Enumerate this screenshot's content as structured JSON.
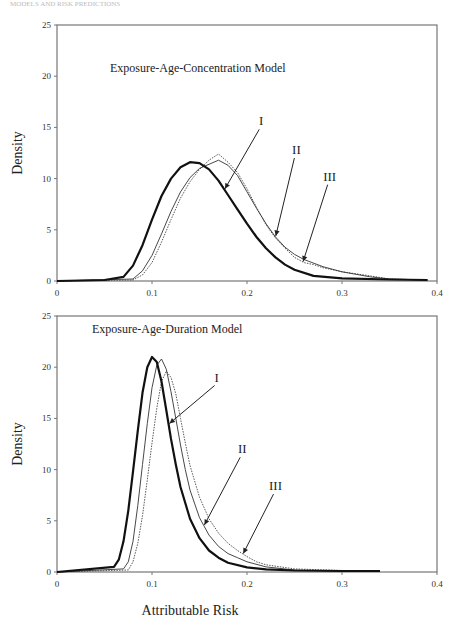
{
  "header": {
    "running_head": "MODELS AND RISK PREDICTIONS"
  },
  "chart_data": [
    {
      "type": "line",
      "title": "Exposure-Age-Concentration Model",
      "xlabel": "",
      "ylabel": "Density",
      "xlim": [
        0,
        0.4
      ],
      "ylim": [
        0,
        25
      ],
      "xticks": [
        "0",
        "0.1",
        "0.2",
        "0.3",
        "0.4"
      ],
      "yticks": [
        "0",
        "5",
        "10",
        "15",
        "20",
        "25"
      ],
      "grid": false,
      "legend": "inline arrow annotations",
      "series": [
        {
          "name": "I",
          "style": "thick solid",
          "x": [
            0,
            0.05,
            0.07,
            0.08,
            0.09,
            0.1,
            0.11,
            0.12,
            0.13,
            0.14,
            0.15,
            0.16,
            0.17,
            0.18,
            0.19,
            0.2,
            0.21,
            0.22,
            0.23,
            0.24,
            0.25,
            0.27,
            0.3,
            0.35,
            0.39
          ],
          "y": [
            0,
            0.1,
            0.4,
            1.5,
            3.5,
            6.0,
            8.3,
            10.0,
            11.1,
            11.6,
            11.5,
            10.9,
            9.8,
            8.4,
            7.0,
            5.6,
            4.3,
            3.2,
            2.3,
            1.6,
            1.1,
            0.5,
            0.25,
            0.15,
            0.1
          ]
        },
        {
          "name": "II",
          "style": "thin solid",
          "x": [
            0,
            0.08,
            0.09,
            0.1,
            0.11,
            0.12,
            0.13,
            0.14,
            0.15,
            0.16,
            0.17,
            0.18,
            0.19,
            0.2,
            0.21,
            0.22,
            0.23,
            0.24,
            0.25,
            0.26,
            0.28,
            0.3,
            0.33,
            0.35,
            0.39
          ],
          "y": [
            0,
            0.2,
            1.0,
            2.5,
            4.6,
            6.8,
            8.7,
            10.1,
            11.0,
            11.4,
            11.8,
            11.3,
            10.3,
            8.7,
            7.1,
            5.6,
            4.3,
            3.3,
            2.6,
            2.1,
            1.4,
            0.9,
            0.4,
            0.2,
            0.1
          ]
        },
        {
          "name": "III",
          "style": "dotted thin",
          "x": [
            0,
            0.08,
            0.09,
            0.1,
            0.11,
            0.12,
            0.13,
            0.14,
            0.15,
            0.16,
            0.17,
            0.18,
            0.19,
            0.2,
            0.21,
            0.22,
            0.23,
            0.24,
            0.25,
            0.26,
            0.27,
            0.28,
            0.3,
            0.33,
            0.35,
            0.39
          ],
          "y": [
            0,
            0.1,
            0.6,
            1.8,
            3.8,
            6.0,
            8.1,
            9.7,
            10.9,
            11.8,
            12.4,
            11.6,
            10.6,
            9.0,
            7.2,
            5.5,
            4.2,
            3.2,
            2.3,
            1.8,
            1.6,
            1.3,
            0.9,
            0.5,
            0.2,
            0.1
          ]
        }
      ],
      "annotations": [
        {
          "text": "I",
          "x": 0.215,
          "y": 15.2
        },
        {
          "text": "II",
          "x": 0.252,
          "y": 12.4
        },
        {
          "text": "III",
          "x": 0.287,
          "y": 9.8
        }
      ]
    },
    {
      "type": "line",
      "title": "Exposure-Age-Duration Model",
      "xlabel": "Attributable Risk",
      "ylabel": "Density",
      "xlim": [
        0,
        0.4
      ],
      "ylim": [
        0,
        25
      ],
      "xticks": [
        "0",
        "0.1",
        "0.2",
        "0.3",
        "0.4"
      ],
      "yticks": [
        "0",
        "5",
        "10",
        "15",
        "20",
        "25"
      ],
      "grid": false,
      "legend": "inline arrow annotations",
      "series": [
        {
          "name": "I",
          "style": "thick solid",
          "x": [
            0,
            0.06,
            0.065,
            0.07,
            0.075,
            0.08,
            0.085,
            0.09,
            0.095,
            0.1,
            0.105,
            0.11,
            0.115,
            0.12,
            0.125,
            0.13,
            0.14,
            0.15,
            0.16,
            0.17,
            0.18,
            0.2,
            0.22,
            0.25,
            0.3,
            0.34
          ],
          "y": [
            0,
            0.5,
            1.2,
            3.0,
            6.0,
            9.8,
            13.8,
            17.5,
            20.0,
            21.0,
            20.5,
            18.6,
            15.8,
            13.0,
            10.5,
            8.3,
            5.2,
            3.3,
            2.1,
            1.4,
            0.9,
            0.45,
            0.25,
            0.15,
            0.1,
            0.1
          ]
        },
        {
          "name": "II",
          "style": "thin solid",
          "x": [
            0,
            0.07,
            0.075,
            0.08,
            0.085,
            0.09,
            0.095,
            0.1,
            0.105,
            0.11,
            0.115,
            0.12,
            0.125,
            0.13,
            0.135,
            0.14,
            0.15,
            0.16,
            0.17,
            0.18,
            0.19,
            0.2,
            0.22,
            0.25,
            0.3,
            0.34
          ],
          "y": [
            0,
            0.3,
            1.0,
            3.0,
            6.5,
            10.5,
            14.5,
            18.0,
            20.2,
            20.8,
            19.8,
            17.6,
            15.0,
            12.4,
            10.0,
            8.0,
            5.3,
            3.6,
            2.5,
            1.8,
            1.4,
            1.0,
            0.5,
            0.2,
            0.1,
            0.1
          ]
        },
        {
          "name": "III",
          "style": "dotted thin",
          "x": [
            0,
            0.075,
            0.08,
            0.085,
            0.09,
            0.095,
            0.1,
            0.105,
            0.11,
            0.115,
            0.12,
            0.125,
            0.13,
            0.135,
            0.14,
            0.15,
            0.16,
            0.17,
            0.18,
            0.19,
            0.2,
            0.21,
            0.22,
            0.25,
            0.3,
            0.34
          ],
          "y": [
            0,
            0.2,
            1.0,
            2.8,
            5.5,
            9.0,
            12.6,
            16.0,
            18.6,
            19.6,
            19.0,
            17.4,
            15.0,
            12.6,
            10.4,
            7.3,
            5.2,
            3.8,
            2.8,
            2.1,
            1.5,
            1.0,
            0.7,
            0.3,
            0.15,
            0.1
          ]
        }
      ],
      "annotations": [
        {
          "text": "I",
          "x": 0.168,
          "y": 18.6
        },
        {
          "text": "II",
          "x": 0.195,
          "y": 11.6
        },
        {
          "text": "III",
          "x": 0.23,
          "y": 8.0
        }
      ]
    }
  ]
}
